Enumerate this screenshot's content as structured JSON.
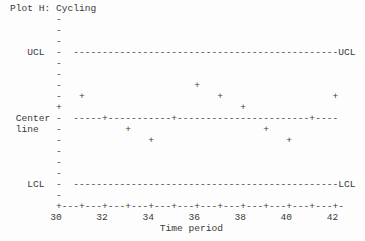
{
  "window": {
    "background_color": "#fdfdfd",
    "text_color": "#3a3a3a"
  },
  "chart_data": {
    "type": "scatter",
    "subtype": "control-chart-pattern-plot",
    "title": "Plot H: Cycling",
    "xlabel": "Time period",
    "marker": "+",
    "x": [
      30,
      31,
      32,
      33,
      34,
      35,
      36,
      37,
      38,
      39,
      40,
      41,
      42
    ],
    "levels": [
      1,
      2,
      0,
      -1,
      -2,
      0,
      3,
      2,
      1,
      -1,
      -2,
      0,
      2
    ],
    "levels_note": "offset in chart rows above (+) or below (-) the center line",
    "xlim": [
      30,
      42
    ],
    "x_tick_labels": [
      "30",
      "32",
      "34",
      "36",
      "38",
      "40",
      "42"
    ],
    "grid_on": false,
    "reference_lines": [
      {
        "name": "ucl",
        "row": 4,
        "left_label": "UCL",
        "left_label2": "",
        "left_label_col": 3,
        "right_label": "UCL"
      },
      {
        "name": "center",
        "row": 10,
        "left_label": "Center",
        "left_label2": "line",
        "left_label_col": 1,
        "right_label": ""
      },
      {
        "name": "lcl",
        "row": 16,
        "left_label": "LCL",
        "left_label2": "",
        "left_label_col": 3,
        "right_label": "LCL"
      }
    ]
  },
  "grid": {
    "rows": 21,
    "cols": 61,
    "title_row": 0,
    "title_col": 0,
    "axis_col": 8,
    "vaxis_row_start": 1,
    "vaxis_row_end": 17,
    "center_row": 10,
    "hline_start_col": 11,
    "hline_end_col": 56,
    "right_label_col": 57,
    "cols_per_unit": 4,
    "xaxis_row": 18,
    "xaxis_end_col": 57,
    "xlabel_row": 19,
    "first_label_col": 7,
    "label_step_cols": 8,
    "time_label_row": 20,
    "time_label_col": 26,
    "dash_char": "-",
    "tick_char": "+"
  }
}
